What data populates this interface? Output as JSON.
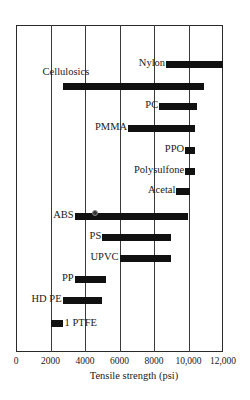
{
  "chart_data": {
    "type": "bar",
    "orientation": "horizontal-range",
    "title": "",
    "xlabel": "Tensile strength (psi)",
    "ylabel": "",
    "xlim": [
      0,
      12000
    ],
    "x_ticks": [
      0,
      2000,
      4000,
      6000,
      8000,
      10000,
      12000
    ],
    "x_tick_labels": [
      "0",
      "2000",
      "4000",
      "6000",
      "8000",
      "10,000",
      "12,000"
    ],
    "grid": "vertical",
    "legend": null,
    "categories": [
      "Nylon",
      "Cellulosics",
      "PC",
      "PMMA",
      "PPO",
      "Polysulfone",
      "Acetal",
      "ABS",
      "PS",
      "UPVC",
      "PP",
      "HD PE",
      "1 PTFE"
    ],
    "series": [
      {
        "name": "Tensile strength range",
        "values": [
          {
            "label": "Nylon",
            "min": 8700,
            "max": 12000
          },
          {
            "label": "Cellulosics",
            "min": 2700,
            "max": 10900
          },
          {
            "label": "PC",
            "min": 8300,
            "max": 10500
          },
          {
            "label": "PMMA",
            "min": 6500,
            "max": 10400
          },
          {
            "label": "PPO",
            "min": 9800,
            "max": 10400
          },
          {
            "label": "Polysulfone",
            "min": 9800,
            "max": 10400
          },
          {
            "label": "Acetal",
            "min": 9300,
            "max": 10100
          },
          {
            "label": "ABS",
            "min": 3400,
            "max": 10000
          },
          {
            "label": "PS",
            "min": 5000,
            "max": 9000
          },
          {
            "label": "UPVC",
            "min": 6000,
            "max": 9000
          },
          {
            "label": "PP",
            "min": 3400,
            "max": 5200
          },
          {
            "label": "HD PE",
            "min": 2700,
            "max": 5000
          },
          {
            "label": "1 PTFE",
            "min": 2000,
            "max": 2700
          }
        ]
      }
    ],
    "annotations": [
      {
        "type": "circle-marker",
        "on": "ABS",
        "x": 4600
      }
    ]
  },
  "layout": {
    "rows_y": [
      64,
      86,
      106,
      128,
      150,
      171,
      191,
      216,
      237,
      258,
      279,
      300,
      323
    ],
    "label_pos": [
      "left",
      "above",
      "left",
      "left",
      "left",
      "left",
      "left",
      "left",
      "left",
      "left",
      "left",
      "left",
      "right"
    ]
  }
}
